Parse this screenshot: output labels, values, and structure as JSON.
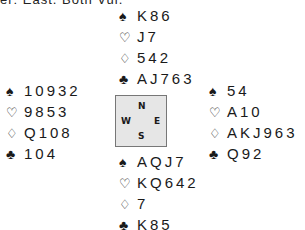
{
  "heading": "er: East. Both Vul.",
  "suits": {
    "spade": "♠",
    "heart": "♡",
    "diamond": "♢",
    "club": "♣"
  },
  "hands": {
    "north": {
      "spades": "K86",
      "hearts": "J7",
      "diamonds": "542",
      "clubs": "AJ763"
    },
    "west": {
      "spades": "10932",
      "hearts": "9853",
      "diamonds": "Q108",
      "clubs": "104"
    },
    "east": {
      "spades": "54",
      "hearts": "A10",
      "diamonds": "AKJ963",
      "clubs": "Q92"
    },
    "south": {
      "spades": "AQJ7",
      "hearts": "KQ642",
      "diamonds": "7",
      "clubs": "K85"
    }
  },
  "compass": {
    "north": "N",
    "west": "W",
    "east": "E",
    "south": "S"
  }
}
